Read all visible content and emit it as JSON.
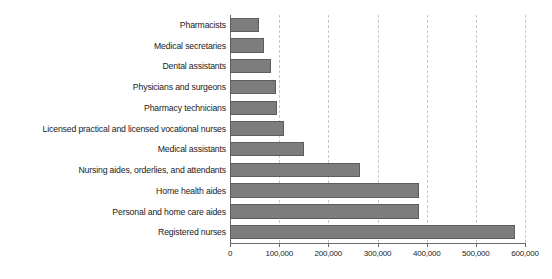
{
  "chart_data": {
    "type": "bar",
    "orientation": "horizontal",
    "title": "",
    "subtitle": "",
    "xlabel": "",
    "ylabel": "",
    "xlim": [
      0,
      600000
    ],
    "grid": true,
    "legend": null,
    "tick_labels": [
      "0",
      "100,000",
      "200,000",
      "300,000",
      "400,000",
      "500,000",
      "600,000"
    ],
    "tick_values": [
      0,
      100000,
      200000,
      300000,
      400000,
      500000,
      600000
    ],
    "categories": [
      "Pharmacists",
      "Medical secretaries",
      "Dental assistants",
      "Physicians and surgeons",
      "Pharmacy technicians",
      "Licensed practical and licensed vocational nurses",
      "Medical assistants",
      "Nursing aides, orderlies, and attendants",
      "Home health aides",
      "Personal and home care aides",
      "Registered nurses"
    ],
    "values": [
      58000,
      70000,
      84000,
      94000,
      95000,
      110000,
      150000,
      265000,
      385000,
      385000,
      580000
    ],
    "colors": {
      "bar_fill": "#7d7d7d",
      "bar_border": "#5d5d5d",
      "gridline": "#c9c9c9",
      "axis": "#6b6b6b",
      "text": "#1a1a1a",
      "background": "#ffffff"
    }
  }
}
